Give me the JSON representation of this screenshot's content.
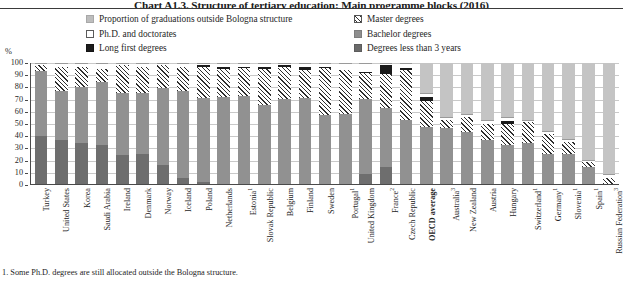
{
  "title": "Chart A1.3. Structure of tertiary education: Main programme blocks (2016)",
  "unit_label": "%",
  "footnote": "1. Some Ph.D. degrees are still allocated outside the Bologna structure.",
  "legend": {
    "items": [
      {
        "key": "outside",
        "label": "Proportion of graduations outside Bologna structure",
        "swatch": "sw-outside",
        "color": "#bdbdbd",
        "column": 1
      },
      {
        "key": "phd",
        "label": "Ph.D. and doctorates",
        "swatch": "sw-phd",
        "color": "#ffffff",
        "column": 1
      },
      {
        "key": "long",
        "label": "Long first degrees",
        "swatch": "sw-long",
        "color": "#1c1c1c",
        "column": 1
      },
      {
        "key": "master",
        "label": "Master degrees",
        "swatch": "sw-master",
        "color": "#2e2e2e",
        "column": 2
      },
      {
        "key": "bachelor",
        "label": "Bachelor degrees",
        "swatch": "sw-bachelor",
        "color": "#8e8e8e",
        "column": 2
      },
      {
        "key": "less3",
        "label": "Degrees less than 3 years",
        "swatch": "sw-less3",
        "color": "#6a6a6a",
        "column": 2
      }
    ]
  },
  "chart_data": {
    "type": "bar",
    "subtype": "stacked-percentage",
    "title": "Chart A1.3. Structure of tertiary education: Main programme blocks (2016)",
    "xlabel": "",
    "ylabel": "%",
    "ylim": [
      0,
      100
    ],
    "yticks": [
      0,
      10,
      20,
      30,
      40,
      50,
      60,
      70,
      80,
      90,
      100
    ],
    "grid": true,
    "legend_position": "top",
    "categories": [
      "Turkey",
      "United States",
      "Korea",
      "Saudi Arabia",
      "Ireland",
      "Denmark",
      "Norway",
      "Iceland",
      "Poland",
      "Netherlands",
      "Estonia¹",
      "Slovak Republic",
      "Belgium",
      "Finland",
      "Sweden",
      "Portugal¹",
      "United Kingdom",
      "France²",
      "Czech Republic",
      "OECD average",
      "Australia³",
      "New Zealand",
      "Austria",
      "Hungary",
      "Switzerland¹",
      "Germany¹",
      "Slovenia¹",
      "Spain¹",
      "Russian Federation³"
    ],
    "series": [
      {
        "name": "Degrees less than 3 years",
        "key": "less3",
        "color": "#6e6e6e",
        "values": [
          40,
          36,
          34,
          32,
          24,
          25,
          16,
          5,
          2,
          0,
          0,
          0,
          0,
          0,
          0,
          0,
          8,
          14,
          0,
          0,
          0,
          0,
          0,
          0,
          0,
          0,
          0,
          0,
          0
        ]
      },
      {
        "name": "Bachelor degrees",
        "key": "bachelor",
        "color": "#919191",
        "values": [
          53,
          41,
          46,
          52,
          51,
          50,
          63,
          72,
          69,
          72,
          73,
          65,
          70,
          71,
          57,
          58,
          62,
          49,
          53,
          47,
          46,
          43,
          36,
          32,
          34,
          25,
          25,
          14,
          0
        ]
      },
      {
        "name": "Master degrees",
        "key": "master",
        "color": "#2e2e2e",
        "values": [
          5,
          20,
          17,
          11,
          23,
          22,
          19,
          20,
          26,
          23,
          23,
          30,
          27,
          23,
          39,
          36,
          22,
          28,
          41,
          22,
          7,
          12,
          14,
          18,
          17,
          16,
          10,
          4,
          5
        ]
      },
      {
        "name": "Long first degrees",
        "key": "long",
        "color": "#1b1b1b",
        "values": [
          0,
          0,
          0,
          0,
          0,
          0,
          0,
          0,
          1,
          2,
          1,
          2,
          1,
          3,
          1,
          0,
          1,
          7,
          2,
          3,
          0,
          0,
          0,
          2,
          0,
          0,
          0,
          0,
          0
        ]
      },
      {
        "name": "Ph.D. and doctorates",
        "key": "phd",
        "color": "#ffffff",
        "values": [
          2,
          3,
          3,
          5,
          2,
          3,
          2,
          3,
          2,
          3,
          3,
          3,
          2,
          3,
          3,
          6,
          7,
          2,
          4,
          3,
          2,
          3,
          3,
          3,
          2,
          3,
          2,
          2,
          3
        ]
      },
      {
        "name": "Proportion of graduations outside Bologna structure",
        "key": "outside",
        "color": "#c4c4c4",
        "values": [
          0,
          0,
          0,
          0,
          0,
          0,
          0,
          0,
          0,
          0,
          0,
          0,
          0,
          0,
          0,
          0,
          0,
          0,
          0,
          25,
          45,
          42,
          47,
          45,
          47,
          56,
          63,
          80,
          92
        ]
      }
    ]
  }
}
